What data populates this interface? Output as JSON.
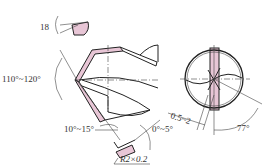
{
  "diagram": {
    "accent_color": "#e8c6d6",
    "labels": {
      "chisel_angle": "18",
      "point_angle": "110°~120°",
      "clearance_angle": "10°~15°",
      "rake_angle": "0°~5°",
      "radius": "R2×0.2",
      "web_thinning": "0.5~2",
      "end_angle": "77°"
    }
  }
}
